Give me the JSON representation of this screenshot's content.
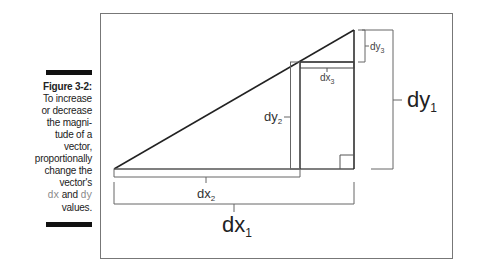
{
  "caption": {
    "title": "Figure 3-2:",
    "lines": [
      "To increase",
      "or decrease",
      "the magni-",
      "tude of a",
      "vector,",
      "proportionally",
      "change the",
      "vector's"
    ],
    "dx": "dx",
    "and": " and ",
    "dy": "dy",
    "end": "values."
  },
  "diagram": {
    "labels": {
      "dx1": "dx",
      "dx1_sub": "1",
      "dy1": "dy",
      "dy1_sub": "1",
      "dx2": "dx",
      "dx2_sub": "2",
      "dy2": "dy",
      "dy2_sub": "2",
      "dx3": "dx",
      "dx3_sub": "3",
      "dy3": "dy",
      "dy3_sub": "3"
    }
  }
}
